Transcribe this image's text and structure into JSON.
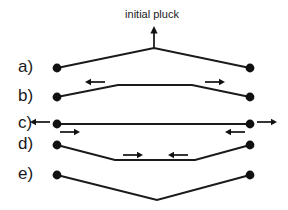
{
  "figure": {
    "title_label": "initial pluck",
    "background_color": "#ffffff",
    "stroke_color": "#1a1a1a",
    "width": 288,
    "height": 210
  },
  "rows": [
    {
      "label": "a)",
      "shape": "triangle-up",
      "description": "initial triangular pluck shape, apex up",
      "left_endpoint": {
        "x": 57,
        "y": 68
      },
      "right_endpoint": {
        "x": 250,
        "y": 68
      },
      "apex": {
        "x": 154,
        "y": 48
      },
      "arrows": []
    },
    {
      "label": "b)",
      "shape": "trapezoid-up",
      "description": "flat-topped trapezoid, pulses moving outward",
      "left_endpoint": {
        "x": 57,
        "y": 97
      },
      "right_endpoint": {
        "x": 250,
        "y": 97
      },
      "plateau_left": {
        "x": 118,
        "y": 85
      },
      "plateau_right": {
        "x": 192,
        "y": 85
      },
      "arrows": [
        {
          "direction": "left",
          "x1": 105,
          "x2": 85,
          "y": 82
        },
        {
          "direction": "right",
          "x1": 205,
          "x2": 225,
          "y": 82
        }
      ]
    },
    {
      "label": "c)",
      "shape": "flat-line",
      "description": "string momentarily straight, pulses at the ends",
      "left_endpoint": {
        "x": 57,
        "y": 124
      },
      "right_endpoint": {
        "x": 250,
        "y": 124
      },
      "arrows": [
        {
          "direction": "left",
          "x1": 50,
          "x2": 30,
          "y": 122
        },
        {
          "direction": "right",
          "x1": 60,
          "x2": 80,
          "y": 132
        },
        {
          "direction": "left",
          "x1": 245,
          "x2": 225,
          "y": 132
        },
        {
          "direction": "right",
          "x1": 257,
          "x2": 277,
          "y": 122
        }
      ]
    },
    {
      "label": "d)",
      "shape": "trapezoid-down",
      "description": "flat-bottomed inverted trapezoid, pulses moving inward",
      "left_endpoint": {
        "x": 57,
        "y": 145
      },
      "right_endpoint": {
        "x": 250,
        "y": 145
      },
      "plateau_left": {
        "x": 115,
        "y": 160
      },
      "plateau_right": {
        "x": 195,
        "y": 160
      },
      "arrows": [
        {
          "direction": "right",
          "x1": 123,
          "x2": 143,
          "y": 155
        },
        {
          "direction": "left",
          "x1": 188,
          "x2": 168,
          "y": 155
        }
      ]
    },
    {
      "label": "e)",
      "shape": "triangle-down",
      "description": "inverted triangular pluck shape, vertex down",
      "left_endpoint": {
        "x": 57,
        "y": 175
      },
      "right_endpoint": {
        "x": 250,
        "y": 175
      },
      "apex": {
        "x": 157,
        "y": 200
      },
      "arrows": []
    }
  ],
  "pluck_marker": {
    "label": "initial pluck",
    "text_x": 152,
    "text_y": 15,
    "arrow_x": 154,
    "arrow_tail_y": 48,
    "arrow_head_y": 26
  },
  "label_column_x": 18,
  "dot_radius": 4.4
}
